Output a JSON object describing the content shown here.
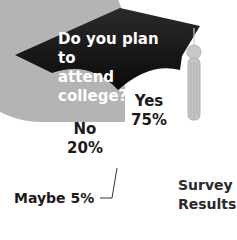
{
  "chart_data": {
    "type": "pie",
    "title": "Do you plan to attend college?",
    "subtitle": "Survey Results",
    "categories": [
      "Yes",
      "No",
      "Maybe"
    ],
    "values": [
      75,
      20,
      5
    ],
    "unit": "%",
    "labels": [
      "Yes 75%",
      "No 20%",
      "Maybe 5%"
    ],
    "colors": {
      "Yes": "#b4b4b4",
      "No": "#8c8c8c",
      "Maybe": "#ededed"
    },
    "decoration": "graduation-cap-with-tassel",
    "legend": "none"
  },
  "text": {
    "title_line1": "Do you plan to",
    "title_line2": "attend college?",
    "yes_label": "Yes",
    "yes_value": "75%",
    "no_label": "No",
    "no_value": "20%",
    "maybe_label": "Maybe 5%",
    "caption_line1": "Survey",
    "caption_line2": "Results"
  }
}
